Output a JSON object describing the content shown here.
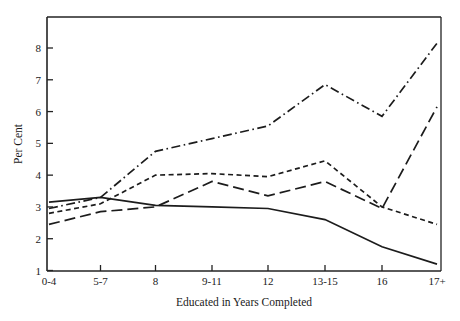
{
  "chart_data": {
    "type": "line",
    "title": "",
    "xlabel": "Educated in Years Completed",
    "ylabel": "Per Cent",
    "categories": [
      "0-4",
      "5-7",
      "8",
      "9-11",
      "12",
      "13-15",
      "16",
      "17+"
    ],
    "ylim": [
      1,
      8.6
    ],
    "yticks": [
      1,
      2,
      3,
      4,
      5,
      6,
      7,
      8
    ],
    "ytick_labels": [
      "1",
      "2",
      "3",
      "4",
      "5",
      "6",
      "7",
      "8"
    ],
    "grid": false,
    "legend": "none",
    "series": [
      {
        "name": "series-solid",
        "style": "solid",
        "values": [
          3.15,
          3.3,
          3.05,
          3.0,
          2.95,
          2.6,
          1.75,
          1.2
        ]
      },
      {
        "name": "series-long-dash",
        "style": "long-dash",
        "values": [
          2.45,
          2.85,
          3.0,
          3.8,
          3.35,
          3.8,
          2.95,
          6.15
        ]
      },
      {
        "name": "series-short-dash",
        "style": "short-dash",
        "values": [
          2.8,
          3.1,
          4.0,
          4.05,
          3.95,
          4.45,
          3.0,
          2.45
        ]
      },
      {
        "name": "series-dash-dot",
        "style": "dash-dot",
        "values": [
          2.95,
          3.3,
          4.75,
          5.15,
          5.55,
          6.85,
          5.85,
          8.15
        ]
      }
    ]
  },
  "axes": {
    "ylabel": "Per Cent",
    "xlabel": "Educated in Years Completed",
    "ytick_labels": [
      "8",
      "7",
      "6",
      "5",
      "4",
      "3",
      "2",
      "1"
    ],
    "xtick_labels": [
      "0-4",
      "5-7",
      "8",
      "9-11",
      "12",
      "13-15",
      "16",
      "17+"
    ]
  },
  "colors": {
    "ink": "#1c1c1c",
    "background": "#ffffff"
  }
}
